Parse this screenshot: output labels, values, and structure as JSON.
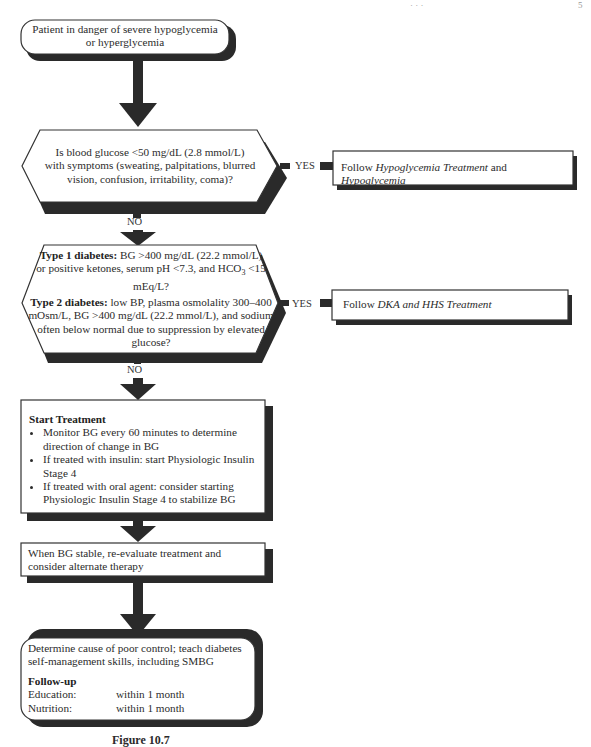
{
  "header": {
    "left_fragment": "· · ·",
    "right_fragment": "5"
  },
  "start": {
    "line1": "Patient in danger of severe hypoglycemia",
    "line2": "or hyperglycemia"
  },
  "decision1": {
    "lines": [
      "Is blood glucose <50 mg/dL (2.8 mmol/L)",
      "with symptoms (sweating, palpitations, blurred",
      "vision, confusion, irritability, coma)?"
    ],
    "yes_label": "YES",
    "no_label": "NO"
  },
  "action1": {
    "prefix": "Follow ",
    "italic1": "Hypoglycemia Treatment",
    "middle": " and ",
    "italic2": "Hypoglycemia"
  },
  "decision2": {
    "type1_heading": "Type 1 diabetes:",
    "type1_text": " BG >400 mg/dL (22.2 mmol/L) or positive ketones, serum pH <7.3, and HCO",
    "type1_sub": "3",
    "type1_tail": " <15 mEq/L?",
    "type2_heading": "Type 2 diabetes:",
    "type2_text": "  low BP, plasma osmolality 300–400 mOsm/L, BG >400 mg/dL (22.2 mmol/L), and sodium often below normal due to suppression by elevated glucose?",
    "yes_label": "YES",
    "no_label": "NO"
  },
  "action2": {
    "prefix": "Follow ",
    "italic": "DKA and HHS Treatment"
  },
  "treatment": {
    "heading": "Start Treatment",
    "bullets": [
      "Monitor BG every 60 minutes to determine direction of change in BG",
      "If treated with insulin: start Physiologic Insulin Stage 4",
      "If treated with oral agent: consider starting Physiologic Insulin Stage 4 to stabilize BG"
    ]
  },
  "reevaluate": {
    "text": "When BG stable, re-evaluate treatment and consider alternate therapy"
  },
  "final": {
    "text": "Determine cause of poor control; teach diabetes self-management skills, including SMBG",
    "followup_heading": "Follow-up",
    "rows": [
      {
        "label": "Education:",
        "value": "within 1 month"
      },
      {
        "label": "Nutrition:",
        "value": "within 1 month"
      }
    ]
  },
  "caption": {
    "text": "Figure 10.7"
  },
  "colors": {
    "ink": "#2b2b2b",
    "shadow": "#2a2a2a",
    "border": "#333333",
    "fill": "#ffffff"
  }
}
